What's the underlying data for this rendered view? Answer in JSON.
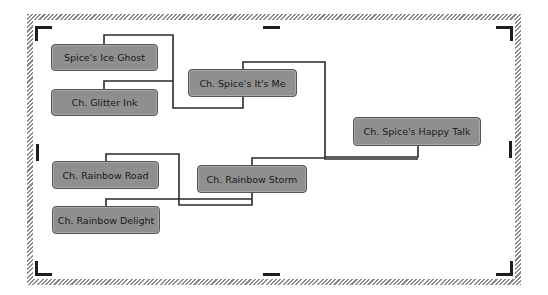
{
  "diagram": {
    "type": "pedigree",
    "colors": {
      "node_fill": "#8f8f8f",
      "node_border": "#555555",
      "line": "#2a2a2a",
      "frame_hatch": "#8a8a8a",
      "handle": "#1e1e1e"
    },
    "nodes": [
      {
        "id": "sire_sire",
        "label": "Spice's Ice Ghost"
      },
      {
        "id": "sire_dam",
        "label": "Ch. Glitter Ink"
      },
      {
        "id": "sire",
        "label": "Ch. Spice's It's Me"
      },
      {
        "id": "subject",
        "label": "Ch. Spice's Happy Talk"
      },
      {
        "id": "dam_sire",
        "label": "Ch. Rainbow Road"
      },
      {
        "id": "dam",
        "label": "Ch. Rainbow Storm"
      },
      {
        "id": "dam_dam",
        "label": "Ch. Rainbow Delight"
      }
    ],
    "edges": [
      {
        "from": "sire_sire",
        "to": "sire"
      },
      {
        "from": "sire_dam",
        "to": "sire"
      },
      {
        "from": "sire",
        "to": "subject"
      },
      {
        "from": "dam_sire",
        "to": "dam"
      },
      {
        "from": "dam_dam",
        "to": "dam"
      },
      {
        "from": "dam",
        "to": "subject"
      }
    ]
  }
}
